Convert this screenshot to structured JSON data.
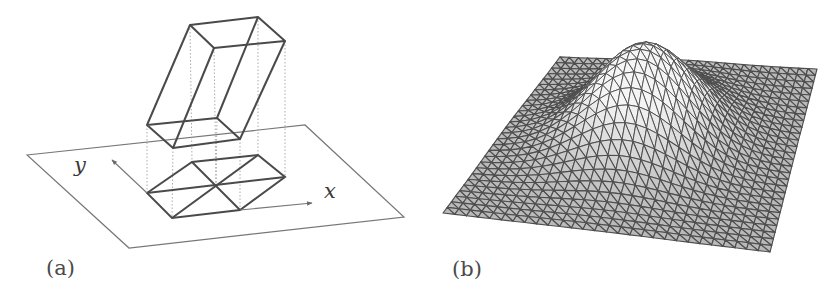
{
  "figure": {
    "panels": [
      {
        "id": "a",
        "label": "(a)",
        "description": "Oblique prism projected onto xy-plane producing triangulated parallelogram footprint",
        "axis_labels": {
          "x": "x",
          "y": "y"
        },
        "label_pos": [
          66,
          275
        ]
      },
      {
        "id": "b",
        "label": "(b)",
        "description": "Triangulated mesh surface with a Gaussian bump",
        "label_pos": [
          472,
          276
        ]
      }
    ],
    "colors": {
      "line": "#4a4a4a",
      "plane": "#6a6a6a",
      "dotted": "#9a9a9a",
      "arrow": "#6a6a6a",
      "mesh": "#555555",
      "mesh_fill": "#ffffff"
    },
    "geometry": {
      "plane": [
        [
          27,
          155
        ],
        [
          305,
          125
        ],
        [
          404,
          217
        ],
        [
          129,
          248
        ]
      ],
      "prism_top": [
        [
          190,
          25
        ],
        [
          258,
          17
        ],
        [
          285,
          41
        ],
        [
          214,
          48
        ]
      ],
      "prism_bottom": [
        [
          147,
          125
        ],
        [
          217,
          118
        ],
        [
          240,
          139
        ],
        [
          173,
          148
        ]
      ],
      "footprint": {
        "left": [
          147,
          193
        ],
        "top_left": [
          192,
          162
        ],
        "top_right": [
          258,
          155
        ],
        "right": [
          285,
          177
        ],
        "bottom_right": [
          240,
          210
        ],
        "bottom_left": [
          172,
          218
        ],
        "center": [
          216,
          185
        ]
      },
      "x_arrow": {
        "from": [
          240,
          210
        ],
        "to": [
          312,
          203
        ]
      },
      "y_arrow": {
        "from": [
          147,
          193
        ],
        "to": [
          112,
          160
        ]
      },
      "mesh": {
        "corners": {
          "top_left": [
            560,
            57
          ],
          "top_right": [
            817,
            69
          ],
          "bottom_right": [
            770,
            252
          ],
          "left": [
            443,
            213
          ]
        },
        "divisions": 28,
        "bump": {
          "u": 0.47,
          "v": 0.45,
          "sigma": 0.17,
          "height": 92
        }
      }
    }
  }
}
